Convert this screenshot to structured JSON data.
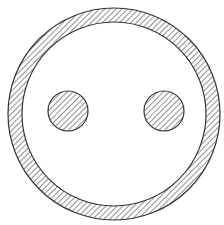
{
  "diagram": {
    "colors": {
      "background": "#ffffff",
      "stroke": "#333333",
      "hatch": "#555555"
    },
    "ring": {
      "cx": 114,
      "cy": 114,
      "outer_r": 106,
      "inner_r": 92
    },
    "dots": [
      {
        "name": "left-dot",
        "cx": 68,
        "cy": 111,
        "r": 20
      },
      {
        "name": "right-dot",
        "cx": 164,
        "cy": 111,
        "r": 20
      }
    ]
  }
}
